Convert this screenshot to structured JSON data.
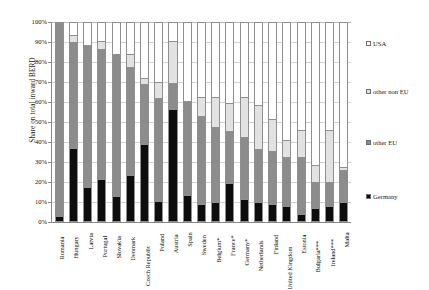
{
  "chart_data": {
    "type": "bar",
    "subtype": "stacked-100-percent",
    "title": "",
    "xlabel": "",
    "ylabel": "Share on total inward BERD",
    "ylim": [
      0,
      100
    ],
    "ytick_labels": [
      "100%",
      "90%",
      "80%",
      "70%",
      "60%",
      "50%",
      "40%",
      "30%",
      "20%",
      "10%",
      "0%"
    ],
    "ytick_values": [
      100,
      90,
      80,
      70,
      60,
      50,
      40,
      30,
      20,
      10,
      0
    ],
    "grid": true,
    "legend_position": "right",
    "categories": [
      "Romania",
      "Hungary",
      "Latvia",
      "Portugal",
      "Slovakia",
      "Denmark",
      "Czech Republic",
      "Poland",
      "Austria",
      "Spain",
      "Sweden",
      "Belgium*",
      "France*",
      "Germany*",
      "Netherlands",
      "Finland",
      "United Kingdom",
      "Estonia",
      "Bulgaria***",
      "Ireland***",
      "Malta"
    ],
    "series": [
      {
        "name": "Germany",
        "color": "#0d0d0d",
        "values": [
          2,
          37,
          17,
          21,
          12,
          23,
          39,
          10,
          57,
          13,
          8,
          9,
          19,
          11,
          9,
          8,
          7,
          3,
          6,
          7,
          9
        ]
      },
      {
        "name": "other EU",
        "color": "#8c8c8c",
        "values": [
          98,
          54,
          72,
          66,
          72,
          55,
          30,
          52,
          13,
          47,
          45,
          38,
          26,
          31,
          27,
          27,
          25,
          29,
          13,
          12,
          16
        ]
      },
      {
        "name": "other non EU",
        "color": "#e2e2e2",
        "values": [
          0,
          3,
          0,
          4,
          0,
          6,
          3,
          8,
          21,
          0,
          9,
          15,
          14,
          20,
          22,
          16,
          8,
          13,
          8,
          26,
          1
        ]
      },
      {
        "name": "USA",
        "color": "#ffffff",
        "values": [
          0,
          6,
          11,
          9,
          16,
          16,
          28,
          30,
          9,
          40,
          38,
          38,
          41,
          38,
          42,
          49,
          60,
          55,
          73,
          55,
          74
        ]
      }
    ]
  },
  "legend": {
    "items": [
      {
        "label": "USA",
        "key": "usa"
      },
      {
        "label": "other non EU",
        "key": "othernoneu"
      },
      {
        "label": "other EU",
        "key": "othereu"
      },
      {
        "label": "Germany",
        "key": "germany"
      }
    ]
  }
}
